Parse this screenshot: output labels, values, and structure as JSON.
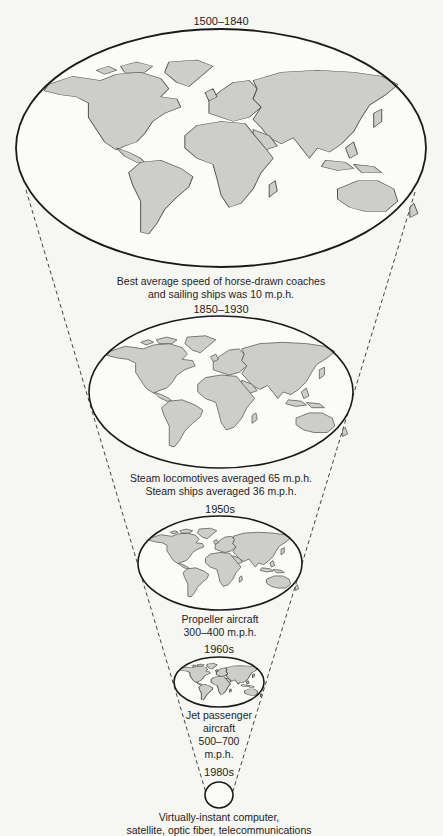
{
  "diagram": {
    "type": "time-space-compression",
    "colors": {
      "background": "#f6f6f3",
      "land_fill": "#cdcdcb",
      "land_stroke": "#555555",
      "ellipse_stroke": "#1a1a1a",
      "dashed_line": "#444444",
      "text": "#1e1e1e"
    },
    "stages": [
      {
        "era": "1500–1840",
        "caption_lines": [
          "Best average speed of horse-drawn coaches",
          "and sailing ships was 10 m.p.h."
        ],
        "ellipse": {
          "cx": 221,
          "cy": 148,
          "rx": 205,
          "ry": 119
        },
        "era_label_y": 15,
        "caption_y": 275
      },
      {
        "era": "1850–1930",
        "caption_lines": [
          "Steam locomotives averaged 65 m.p.h.",
          "Steam ships averaged 36 m.p.h."
        ],
        "ellipse": {
          "cx": 221,
          "cy": 392,
          "rx": 132,
          "ry": 76
        },
        "era_label_y": 303,
        "caption_y": 472
      },
      {
        "era": "1950s",
        "caption_lines": [
          "Propeller aircraft",
          "300–400 m.p.h."
        ],
        "ellipse": {
          "cx": 220,
          "cy": 563,
          "rx": 82,
          "ry": 47
        },
        "era_label_y": 503,
        "caption_y": 613
      },
      {
        "era": "1960s",
        "caption_lines": [
          "Jet passenger",
          "aircraft",
          "500–700",
          "m.p.h."
        ],
        "ellipse": {
          "cx": 219,
          "cy": 682,
          "rx": 45,
          "ry": 25
        },
        "era_label_y": 643,
        "caption_y": 709
      },
      {
        "era": "1980s",
        "caption_lines": [
          "Virtually-instant computer,",
          "satellite, optic fiber, telecommunications"
        ],
        "ellipse": {
          "cx": 219,
          "cy": 795,
          "rx": 14,
          "ry": 13
        },
        "era_label_y": 766,
        "caption_y": 811
      }
    ],
    "funnel_lines": {
      "left": {
        "x1": 26,
        "y1": 190,
        "x2": 206,
        "y2": 793
      },
      "right": {
        "x1": 415,
        "y1": 192,
        "x2": 233,
        "y2": 791
      }
    }
  }
}
